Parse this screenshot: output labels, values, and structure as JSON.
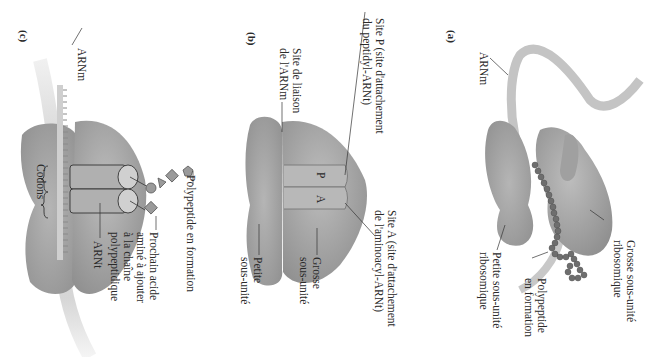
{
  "figure": {
    "orientation": "rotated 90 degrees clockwise",
    "colors": {
      "ribosome": "#a9a9a9",
      "ribosome_dark": "#8c8c8c",
      "mrna": "#c8c8c8",
      "polypeptide": "#7a7a7a",
      "line": "#333333"
    }
  },
  "panels": {
    "a": {
      "letter": "(a)",
      "labels": {
        "mrna": "ARNm",
        "large_subunit_1": "Grosse sous-unité",
        "large_subunit_2": "ribosomique",
        "polypeptide_1": "Polypeptide",
        "polypeptide_2": "en formation",
        "small_subunit_1": "Petite sous-unité",
        "small_subunit_2": "ribosomique"
      }
    },
    "b": {
      "letter": "(b)",
      "labels": {
        "p_site_1": "Site P (site d'attachement",
        "p_site_2": "du peptidyl-ARNt)",
        "mrna_site_1": "Site de liaison",
        "mrna_site_2": "de l'ARNm",
        "a_site_1": "Site A (site d'attachement",
        "a_site_2": "de l'aminoacyl-ARNt)",
        "large_1": "Grosse",
        "large_2": "sous-unité",
        "small_1": "Petite",
        "small_2": "sous-unité",
        "p": "P",
        "a": "A"
      }
    },
    "c": {
      "letter": "(c)",
      "labels": {
        "mrna": "ARNm",
        "codons": "Codons",
        "polypeptide": "Polypeptide en formation",
        "next_aa_1": "Prochain acide",
        "next_aa_2": "aminé à ajouter",
        "next_aa_3": "à la chaîne",
        "next_aa_4": "polypeptidique",
        "trna": "ARNt"
      }
    }
  }
}
